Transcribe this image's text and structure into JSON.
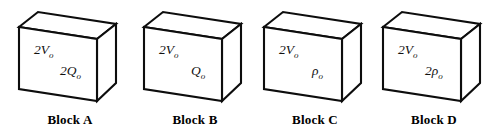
{
  "figure": {
    "background_color": "#ffffff",
    "line_color": "#0d0d0d",
    "text_color": "#111111"
  },
  "blocks": [
    {
      "id": "block-a",
      "caption": "Block A",
      "volume_label": "2V",
      "volume_sub": "o",
      "quantity_label": "2Q",
      "quantity_sub": "o"
    },
    {
      "id": "block-b",
      "caption": "Block B",
      "volume_label": "2V",
      "volume_sub": "o",
      "quantity_label": "Q",
      "quantity_sub": "o"
    },
    {
      "id": "block-c",
      "caption": "Block C",
      "volume_label": "2V",
      "volume_sub": "o",
      "quantity_label": "ρ",
      "quantity_sub": "o"
    },
    {
      "id": "block-d",
      "caption": "Block D",
      "volume_label": "2V",
      "volume_sub": "o",
      "quantity_label": "2ρ",
      "quantity_sub": "o"
    }
  ]
}
